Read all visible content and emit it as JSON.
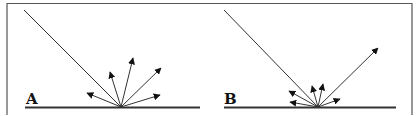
{
  "figure": {
    "colors": {
      "line": "#333333",
      "frame": "#555555",
      "background": "#ffffff"
    },
    "panels": [
      {
        "id": "A",
        "label": "A",
        "type": "diffuse reflection",
        "incident_ray": "incoming ray from upper left",
        "reflected_rays": [
          {
            "name": "left-low",
            "length": "medium"
          },
          {
            "name": "left-high",
            "length": "medium"
          },
          {
            "name": "vertical",
            "length": "long"
          },
          {
            "name": "right-high",
            "length": "long"
          },
          {
            "name": "right-low",
            "length": "medium"
          }
        ]
      },
      {
        "id": "B",
        "label": "B",
        "type": "specular plus diffuse reflection",
        "incident_ray": "incoming ray from upper left",
        "reflected_rays": [
          {
            "name": "left-high",
            "length": "short"
          },
          {
            "name": "left-low",
            "length": "short"
          },
          {
            "name": "mid-left",
            "length": "short"
          },
          {
            "name": "vertical",
            "length": "short"
          },
          {
            "name": "right-low",
            "length": "short"
          },
          {
            "name": "specular",
            "length": "long"
          }
        ]
      }
    ]
  }
}
